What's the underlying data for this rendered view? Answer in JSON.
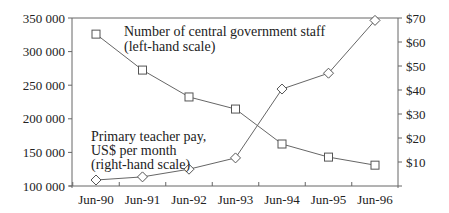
{
  "chart_data": {
    "type": "line",
    "title": "",
    "categories": [
      "Jun-90",
      "Jun-91",
      "Jun-92",
      "Jun-93",
      "Jun-94",
      "Jun-95",
      "Jun-96"
    ],
    "series": [
      {
        "name": "Number of central government staff (left-hand scale)",
        "axis": "left",
        "marker": "square",
        "values": [
          326000,
          272500,
          232500,
          214500,
          162500,
          143000,
          131000
        ]
      },
      {
        "name": "Primary teacher pay, US$ per month (right-hand scale)",
        "axis": "right",
        "marker": "diamond",
        "values": [
          2.5,
          3.8,
          7,
          11.7,
          40.4,
          47,
          69
        ]
      }
    ],
    "left_axis": {
      "ylim": [
        100000,
        350000
      ],
      "ticks": [
        100000,
        150000,
        200000,
        250000,
        300000,
        350000
      ],
      "tick_labels": [
        "100 000",
        "150 000",
        "200 000",
        "250 000",
        "300 000",
        "350 000"
      ]
    },
    "right_axis": {
      "ylim": [
        0,
        70
      ],
      "ticks": [
        10,
        20,
        30,
        40,
        50,
        60,
        70
      ],
      "tick_labels": [
        "$10",
        "$20",
        "$30",
        "$40",
        "$50",
        "$60",
        "$70"
      ]
    },
    "annotations": {
      "staff": [
        "Number of central government staff",
        "(left-hand scale)"
      ],
      "pay": [
        "Primary teacher pay,",
        "US$ per month",
        "(right-hand scale)"
      ]
    },
    "grid": false,
    "legend": "inline annotations"
  }
}
